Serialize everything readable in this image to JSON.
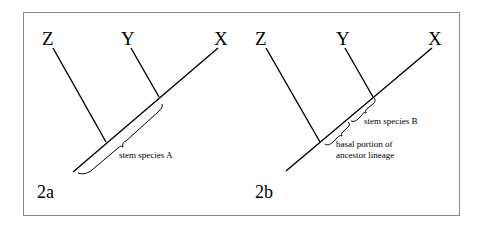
{
  "figure": {
    "panel_a": {
      "label": "2a",
      "taxa": [
        "Z",
        "Y",
        "X"
      ],
      "annotation": "stem species A"
    },
    "panel_b": {
      "label": "2b",
      "taxa": [
        "Z",
        "Y",
        "X"
      ],
      "annotation_upper": "stem species B",
      "annotation_lower_line1": "basal portion of",
      "annotation_lower_line2": "ancestor lineage"
    }
  }
}
